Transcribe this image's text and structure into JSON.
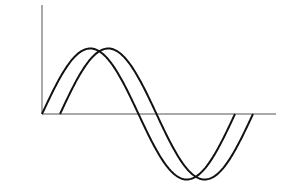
{
  "diagram": {
    "type": "phase-shifted-sine-waves",
    "background": "#ffffff",
    "stroke_color": "#111111",
    "axis_color": "#555555",
    "axes": {
      "origin": [
        42,
        114
      ],
      "y_axis_top": 5,
      "x_axis_right": 276
    },
    "waves": [
      {
        "name": "wave-leading",
        "start_x": 42,
        "period": 193,
        "amplitude": 65.5,
        "cycles": 1
      },
      {
        "name": "wave-lagging",
        "start_x": 60,
        "period": 193,
        "amplitude": 65.5,
        "cycles": 1
      }
    ]
  }
}
